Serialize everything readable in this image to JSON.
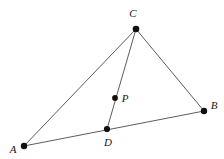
{
  "figure": {
    "kind": "geometry-diagram",
    "canvas": {
      "width": 224,
      "height": 159,
      "background": "#ffffff"
    },
    "style": {
      "edge_color": "#4a4a4a",
      "edge_width": 0.9,
      "dot_color": "#101010",
      "dot_radius": 3.1,
      "label_color": "#181818",
      "label_size": 11
    },
    "points": [
      {
        "id": "A",
        "label": "A",
        "x": 24,
        "y": 146,
        "label_x": 13,
        "label_y": 150,
        "dot_radius": 3.2
      },
      {
        "id": "B",
        "label": "B",
        "x": 204,
        "y": 111,
        "label_x": 214,
        "label_y": 106,
        "dot_radius": 3.2
      },
      {
        "id": "C",
        "label": "C",
        "x": 136,
        "y": 29,
        "label_x": 133,
        "label_y": 14,
        "dot_radius": 3.3
      },
      {
        "id": "D",
        "label": "D",
        "x": 107,
        "y": 129,
        "label_x": 108,
        "label_y": 143,
        "dot_radius": 3.1
      },
      {
        "id": "P",
        "label": "P",
        "x": 115,
        "y": 98,
        "label_x": 125,
        "label_y": 99,
        "dot_radius": 2.9
      }
    ],
    "edges": [
      {
        "id": "AC",
        "from": "A",
        "to": "C",
        "x1": 24,
        "y1": 146,
        "x2": 136,
        "y2": 29
      },
      {
        "id": "AB",
        "from": "A",
        "to": "B",
        "x1": 24,
        "y1": 146,
        "x2": 204,
        "y2": 111
      },
      {
        "id": "CB",
        "from": "C",
        "to": "B",
        "x1": 136,
        "y1": 29,
        "x2": 204,
        "y2": 111
      },
      {
        "id": "CD",
        "from": "C",
        "to": "D",
        "x1": 136,
        "y1": 29,
        "x2": 107,
        "y2": 129
      }
    ]
  }
}
